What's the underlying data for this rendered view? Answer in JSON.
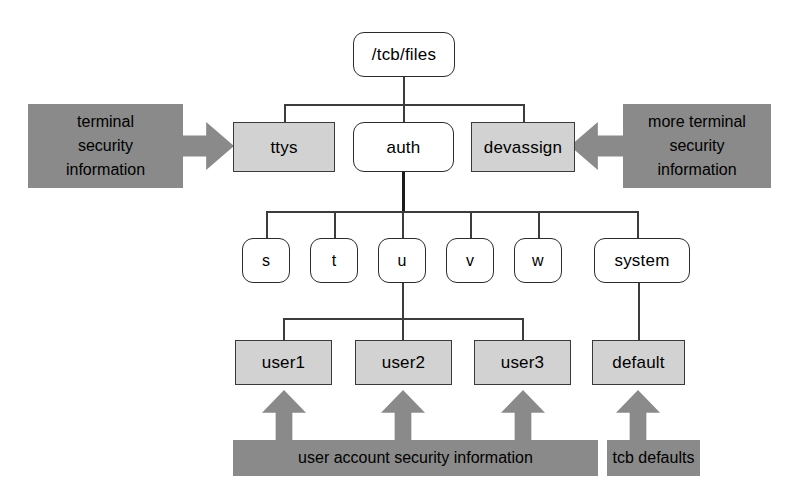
{
  "diagram": {
    "colors": {
      "node_gray": "#d2d2d2",
      "callout_gray": "#8a8a8a",
      "line": "#3c3c3c",
      "background": "#ffffff"
    },
    "nodes": {
      "root": "/tcb/files",
      "level2": [
        {
          "label": "ttys",
          "style": "gray"
        },
        {
          "label": "auth",
          "style": "white"
        },
        {
          "label": "devassign",
          "style": "gray"
        }
      ],
      "level3": [
        {
          "label": "s",
          "style": "white"
        },
        {
          "label": "t",
          "style": "white"
        },
        {
          "label": "u",
          "style": "white"
        },
        {
          "label": "v",
          "style": "white"
        },
        {
          "label": "w",
          "style": "white"
        },
        {
          "label": "system",
          "style": "white"
        }
      ],
      "level4": [
        {
          "label": "user1",
          "style": "gray"
        },
        {
          "label": "user2",
          "style": "gray"
        },
        {
          "label": "user3",
          "style": "gray"
        },
        {
          "label": "default",
          "style": "gray"
        }
      ]
    },
    "callouts": {
      "left": {
        "lines": [
          "terminal",
          "security",
          "information"
        ],
        "arrow": "arrow-right-icon"
      },
      "right": {
        "lines": [
          "more terminal",
          "security",
          "information"
        ],
        "arrow": "arrow-left-icon"
      },
      "bottom_left": {
        "label": "user account security information",
        "arrow": "arrow-up-icon",
        "arrow_count": 3
      },
      "bottom_right": {
        "label": "tcb defaults",
        "arrow": "arrow-up-icon",
        "arrow_count": 1
      }
    }
  }
}
